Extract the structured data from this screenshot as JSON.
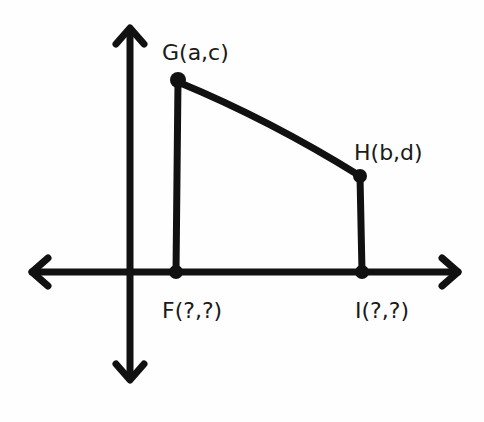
{
  "diagram": {
    "stroke_color": "#111111",
    "background_color": "#fefefe",
    "points": [
      {
        "id": "G",
        "label": "G(a,c)",
        "x": 178,
        "y": 80
      },
      {
        "id": "H",
        "label": "H(b,d)",
        "x": 360,
        "y": 176
      },
      {
        "id": "F",
        "label": "F(?,?)",
        "x": 176,
        "y": 272
      },
      {
        "id": "I",
        "label": "I(?,?)",
        "x": 362,
        "y": 272
      }
    ],
    "axes": {
      "x_axis": {
        "y": 272,
        "from": 30,
        "to": 460,
        "arrows": "both"
      },
      "y_axis": {
        "x": 130,
        "from": 28,
        "to": 380,
        "arrows": "both"
      }
    },
    "segments": [
      {
        "from": "G",
        "to": "H"
      },
      {
        "from": "G",
        "to": "F"
      },
      {
        "from": "H",
        "to": "I"
      }
    ]
  }
}
